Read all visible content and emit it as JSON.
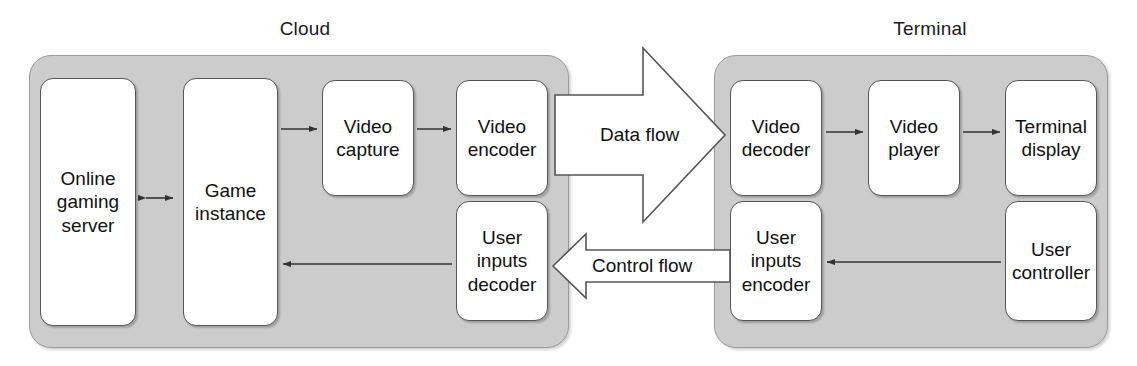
{
  "diagram": {
    "background": "#ffffff",
    "container_fill": "#cccccc",
    "node_fill": "#ffffff",
    "stroke": "#555555"
  },
  "groups": [
    {
      "id": "cloud",
      "label": "Cloud"
    },
    {
      "id": "terminal",
      "label": "Terminal"
    }
  ],
  "nodes": {
    "online_gaming_server": {
      "lines": [
        "Online",
        "gaming",
        "server"
      ]
    },
    "game_instance": {
      "lines": [
        "Game",
        "instance"
      ]
    },
    "video_capture": {
      "lines": [
        "Video",
        "capture"
      ]
    },
    "video_encoder": {
      "lines": [
        "Video",
        "encoder"
      ]
    },
    "user_inputs_decoder": {
      "lines": [
        "User",
        "inputs",
        "decoder"
      ]
    },
    "video_decoder": {
      "lines": [
        "Video",
        "decoder"
      ]
    },
    "video_player": {
      "lines": [
        "Video",
        "player"
      ]
    },
    "terminal_display": {
      "lines": [
        "Terminal",
        "display"
      ]
    },
    "user_inputs_encoder": {
      "lines": [
        "User",
        "inputs",
        "encoder"
      ]
    },
    "user_controller": {
      "lines": [
        "User",
        "controller"
      ]
    }
  },
  "flows": {
    "data_flow": {
      "label": "Data flow",
      "direction": "right"
    },
    "control_flow": {
      "label": "Control flow",
      "direction": "left"
    }
  },
  "connections": [
    {
      "from": "online_gaming_server",
      "to": "game_instance",
      "type": "bidirectional"
    },
    {
      "from": "game_instance",
      "to": "video_capture",
      "type": "arrow"
    },
    {
      "from": "video_capture",
      "to": "video_encoder",
      "type": "arrow"
    },
    {
      "from": "user_inputs_decoder",
      "to": "game_instance",
      "type": "arrow"
    },
    {
      "from": "video_decoder",
      "to": "video_player",
      "type": "arrow"
    },
    {
      "from": "video_player",
      "to": "terminal_display",
      "type": "arrow"
    },
    {
      "from": "user_controller",
      "to": "user_inputs_encoder",
      "type": "arrow"
    }
  ]
}
